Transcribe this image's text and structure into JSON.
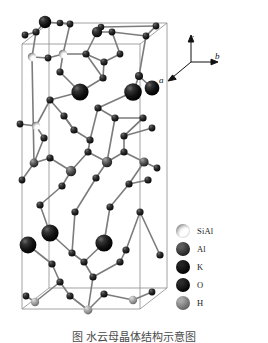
{
  "figure": {
    "type": "crystal-structure-unit-cell",
    "background_color": "#ffffff",
    "caption": "图    水云母晶体结构示意图"
  },
  "axes": {
    "label_a": "a",
    "label_b": "b",
    "label_c": "c",
    "origin_x": 33,
    "origin_y": 30,
    "c_tip_x": 33,
    "c_tip_y": 5,
    "b_tip_x": 58,
    "b_tip_y": 30,
    "a_tip_x": 8,
    "a_tip_y": 50
  },
  "legend": {
    "items": [
      {
        "label": "SiAl",
        "style": "crescent",
        "color": "#f4f4f4",
        "shade_color": "#6e6e6e",
        "icon": "sphere-icon"
      },
      {
        "label": "Al",
        "style": "sphere",
        "color": "#5c5c5c",
        "shade_color": "#1d1d1d",
        "icon": "sphere-icon"
      },
      {
        "label": "K",
        "style": "sphere",
        "color": "#232323",
        "shade_color": "#000000",
        "icon": "sphere-icon"
      },
      {
        "label": "O",
        "style": "sphere",
        "color": "#2b2b2b",
        "shade_color": "#000000",
        "icon": "sphere-icon"
      },
      {
        "label": "H",
        "style": "sphere",
        "color": "#a8a8a8",
        "shade_color": "#5e5e5e",
        "icon": "sphere-icon"
      }
    ]
  },
  "cell_box": {
    "stroke_color": "#8a8a8a",
    "stroke_width": 0.8,
    "front_bottom_left": [
      22,
      309
    ],
    "front_bottom_right": [
      140,
      309
    ],
    "front_top_left": [
      22,
      44
    ],
    "front_top_right": [
      140,
      44
    ],
    "back_bottom_left": [
      49,
      288
    ],
    "back_bottom_right": [
      167,
      288
    ],
    "back_top_left": [
      49,
      23
    ],
    "back_top_right": [
      167,
      23
    ]
  },
  "structure": {
    "bond_color": "#7c7c7c",
    "bond_width": 1.6,
    "atoms": [
      {
        "id": 0,
        "type": "K",
        "x": 45,
        "y": 22,
        "r": 6.2
      },
      {
        "id": 1,
        "type": "O",
        "x": 97,
        "y": 32,
        "r": 5.2
      },
      {
        "id": 2,
        "type": "O",
        "x": 36,
        "y": 32,
        "r": 3.6
      },
      {
        "id": 3,
        "type": "O",
        "x": 70,
        "y": 24,
        "r": 3.4
      },
      {
        "id": 4,
        "type": "O",
        "x": 60,
        "y": 23,
        "r": 3.3
      },
      {
        "id": 5,
        "type": "O",
        "x": 101,
        "y": 27,
        "r": 3.3
      },
      {
        "id": 6,
        "type": "O",
        "x": 112,
        "y": 32,
        "r": 3.4
      },
      {
        "id": 7,
        "type": "O",
        "x": 156,
        "y": 26,
        "r": 3.4
      },
      {
        "id": 8,
        "type": "O",
        "x": 146,
        "y": 36,
        "r": 3.4
      },
      {
        "id": 9,
        "type": "O",
        "x": 25,
        "y": 35,
        "r": 3.4
      },
      {
        "id": 10,
        "type": "SiAl",
        "x": 32,
        "y": 57,
        "r": 4.2
      },
      {
        "id": 11,
        "type": "SiAl",
        "x": 63,
        "y": 54,
        "r": 4.2
      },
      {
        "id": 12,
        "type": "O",
        "x": 48,
        "y": 58,
        "r": 3.4
      },
      {
        "id": 13,
        "type": "O",
        "x": 86,
        "y": 54,
        "r": 3.6
      },
      {
        "id": 14,
        "type": "O",
        "x": 104,
        "y": 62,
        "r": 3.6
      },
      {
        "id": 15,
        "type": "O",
        "x": 120,
        "y": 54,
        "r": 3.4
      },
      {
        "id": 16,
        "type": "K",
        "x": 80,
        "y": 92,
        "r": 8.6
      },
      {
        "id": 17,
        "type": "K",
        "x": 133,
        "y": 92,
        "r": 8.8
      },
      {
        "id": 18,
        "type": "K",
        "x": 152,
        "y": 88,
        "r": 7.4
      },
      {
        "id": 19,
        "type": "O",
        "x": 103,
        "y": 78,
        "r": 3.6
      },
      {
        "id": 20,
        "type": "O",
        "x": 139,
        "y": 76,
        "r": 4.0
      },
      {
        "id": 21,
        "type": "O",
        "x": 60,
        "y": 72,
        "r": 3.6
      },
      {
        "id": 22,
        "type": "O",
        "x": 50,
        "y": 100,
        "r": 3.6
      },
      {
        "id": 23,
        "type": "O",
        "x": 98,
        "y": 108,
        "r": 3.6
      },
      {
        "id": 24,
        "type": "O",
        "x": 115,
        "y": 118,
        "r": 3.6
      },
      {
        "id": 25,
        "type": "O",
        "x": 143,
        "y": 118,
        "r": 3.6
      },
      {
        "id": 26,
        "type": "O",
        "x": 64,
        "y": 116,
        "r": 3.6
      },
      {
        "id": 27,
        "type": "SiAl",
        "x": 36,
        "y": 126,
        "r": 4.2
      },
      {
        "id": 28,
        "type": "O",
        "x": 44,
        "y": 138,
        "r": 3.6
      },
      {
        "id": 29,
        "type": "O",
        "x": 74,
        "y": 130,
        "r": 3.6
      },
      {
        "id": 30,
        "type": "O",
        "x": 90,
        "y": 140,
        "r": 3.6
      },
      {
        "id": 31,
        "type": "O",
        "x": 124,
        "y": 136,
        "r": 3.6
      },
      {
        "id": 32,
        "type": "Al",
        "x": 34,
        "y": 163,
        "r": 4.4
      },
      {
        "id": 33,
        "type": "Al",
        "x": 71,
        "y": 171,
        "r": 5.2
      },
      {
        "id": 34,
        "type": "Al",
        "x": 107,
        "y": 162,
        "r": 5.2
      },
      {
        "id": 35,
        "type": "Al",
        "x": 144,
        "y": 162,
        "r": 4.6
      },
      {
        "id": 36,
        "type": "O",
        "x": 50,
        "y": 158,
        "r": 3.6
      },
      {
        "id": 37,
        "type": "O",
        "x": 88,
        "y": 152,
        "r": 3.6
      },
      {
        "id": 38,
        "type": "O",
        "x": 124,
        "y": 152,
        "r": 3.6
      },
      {
        "id": 39,
        "type": "O",
        "x": 62,
        "y": 186,
        "r": 3.6
      },
      {
        "id": 40,
        "type": "O",
        "x": 96,
        "y": 178,
        "r": 3.6
      },
      {
        "id": 41,
        "type": "O",
        "x": 129,
        "y": 184,
        "r": 3.6
      },
      {
        "id": 42,
        "type": "O",
        "x": 148,
        "y": 180,
        "r": 3.6
      },
      {
        "id": 43,
        "type": "O",
        "x": 40,
        "y": 205,
        "r": 3.6
      },
      {
        "id": 44,
        "type": "O",
        "x": 75,
        "y": 212,
        "r": 3.6
      },
      {
        "id": 45,
        "type": "O",
        "x": 110,
        "y": 207,
        "r": 3.6
      },
      {
        "id": 46,
        "type": "O",
        "x": 140,
        "y": 212,
        "r": 3.6
      },
      {
        "id": 47,
        "type": "K",
        "x": 50,
        "y": 233,
        "r": 8.6
      },
      {
        "id": 48,
        "type": "K",
        "x": 28,
        "y": 245,
        "r": 8.4
      },
      {
        "id": 49,
        "type": "K",
        "x": 104,
        "y": 243,
        "r": 8.6
      },
      {
        "id": 50,
        "type": "O",
        "x": 72,
        "y": 253,
        "r": 3.6
      },
      {
        "id": 51,
        "type": "O",
        "x": 126,
        "y": 250,
        "r": 3.6
      },
      {
        "id": 52,
        "type": "O",
        "x": 84,
        "y": 262,
        "r": 3.6
      },
      {
        "id": 53,
        "type": "O",
        "x": 120,
        "y": 262,
        "r": 3.6
      },
      {
        "id": 54,
        "type": "O",
        "x": 52,
        "y": 264,
        "r": 3.6
      },
      {
        "id": 55,
        "type": "O",
        "x": 93,
        "y": 277,
        "r": 3.6
      },
      {
        "id": 56,
        "type": "O",
        "x": 60,
        "y": 282,
        "r": 3.6
      },
      {
        "id": 57,
        "type": "H",
        "x": 35,
        "y": 302,
        "r": 4.2
      },
      {
        "id": 58,
        "type": "O",
        "x": 26,
        "y": 296,
        "r": 3.4
      },
      {
        "id": 59,
        "type": "O",
        "x": 70,
        "y": 296,
        "r": 3.6
      },
      {
        "id": 60,
        "type": "H",
        "x": 88,
        "y": 310,
        "r": 4.4
      },
      {
        "id": 61,
        "type": "O",
        "x": 104,
        "y": 294,
        "r": 3.6
      },
      {
        "id": 62,
        "type": "H",
        "x": 133,
        "y": 300,
        "r": 4.2
      },
      {
        "id": 63,
        "type": "O",
        "x": 152,
        "y": 292,
        "r": 3.4
      },
      {
        "id": 64,
        "type": "O",
        "x": 160,
        "y": 255,
        "r": 3.6
      },
      {
        "id": 65,
        "type": "O",
        "x": 157,
        "y": 168,
        "r": 3.4
      },
      {
        "id": 66,
        "type": "O",
        "x": 22,
        "y": 180,
        "r": 3.4
      },
      {
        "id": 67,
        "type": "O",
        "x": 20,
        "y": 124,
        "r": 3.4
      },
      {
        "id": 68,
        "type": "O",
        "x": 152,
        "y": 128,
        "r": 3.4
      }
    ],
    "bonds": [
      [
        0,
        3
      ],
      [
        0,
        2
      ],
      [
        3,
        4
      ],
      [
        1,
        5
      ],
      [
        1,
        6
      ],
      [
        1,
        13
      ],
      [
        5,
        7
      ],
      [
        7,
        8
      ],
      [
        8,
        6
      ],
      [
        2,
        9
      ],
      [
        2,
        10
      ],
      [
        10,
        12
      ],
      [
        12,
        11
      ],
      [
        11,
        3
      ],
      [
        11,
        13
      ],
      [
        13,
        14
      ],
      [
        14,
        15
      ],
      [
        15,
        6
      ],
      [
        10,
        32
      ],
      [
        16,
        19
      ],
      [
        16,
        21
      ],
      [
        16,
        22
      ],
      [
        19,
        14
      ],
      [
        17,
        20
      ],
      [
        17,
        23
      ],
      [
        18,
        20
      ],
      [
        20,
        8
      ],
      [
        21,
        11
      ],
      [
        22,
        27
      ],
      [
        23,
        24
      ],
      [
        24,
        25
      ],
      [
        25,
        31
      ],
      [
        26,
        29
      ],
      [
        27,
        28
      ],
      [
        28,
        32
      ],
      [
        29,
        30
      ],
      [
        30,
        23
      ],
      [
        31,
        25
      ],
      [
        26,
        22
      ],
      [
        29,
        26
      ],
      [
        32,
        36
      ],
      [
        36,
        33
      ],
      [
        33,
        37
      ],
      [
        37,
        34
      ],
      [
        34,
        38
      ],
      [
        38,
        35
      ],
      [
        33,
        39
      ],
      [
        34,
        40
      ],
      [
        35,
        41
      ],
      [
        41,
        42
      ],
      [
        39,
        43
      ],
      [
        40,
        44
      ],
      [
        45,
        41
      ],
      [
        43,
        47
      ],
      [
        44,
        50
      ],
      [
        45,
        49
      ],
      [
        46,
        51
      ],
      [
        47,
        50
      ],
      [
        48,
        54
      ],
      [
        49,
        52
      ],
      [
        50,
        52
      ],
      [
        52,
        55
      ],
      [
        53,
        55
      ],
      [
        51,
        53
      ],
      [
        54,
        56
      ],
      [
        56,
        59
      ],
      [
        59,
        60
      ],
      [
        55,
        60
      ],
      [
        61,
        60
      ],
      [
        61,
        62
      ],
      [
        62,
        63
      ],
      [
        58,
        57
      ],
      [
        57,
        56
      ],
      [
        35,
        65
      ],
      [
        66,
        32
      ],
      [
        67,
        27
      ],
      [
        68,
        31
      ],
      [
        64,
        46
      ],
      [
        13,
        19
      ],
      [
        31,
        38
      ],
      [
        24,
        34
      ],
      [
        30,
        37
      ]
    ]
  }
}
